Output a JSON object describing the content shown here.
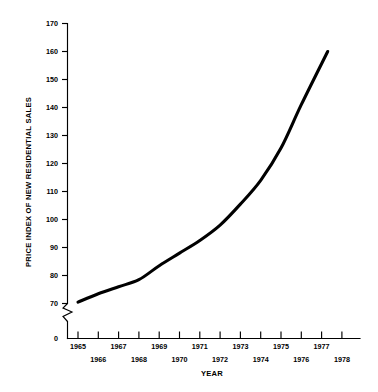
{
  "chart_data": {
    "type": "line",
    "title": "",
    "xlabel": "YEAR",
    "ylabel": "PRICE INDEX OF NEW RESIDENTIAL SALES",
    "xlim": [
      1964.5,
      1978.5
    ],
    "ylim": [
      70,
      170
    ],
    "axis_break": true,
    "axis_break_label": "0",
    "grid": false,
    "legend": null,
    "y_ticks": [
      70,
      80,
      90,
      100,
      110,
      120,
      130,
      140,
      150,
      160,
      170
    ],
    "y_tick_labels": [
      "70",
      "80",
      "90",
      "100",
      "110",
      "120",
      "130",
      "140",
      "150",
      "160",
      "170"
    ],
    "x_ticks": [
      1965,
      1966,
      1967,
      1968,
      1969,
      1970,
      1971,
      1972,
      1973,
      1974,
      1975,
      1976,
      1977,
      1978
    ],
    "x_tick_labels_top": [
      "1965",
      "1967",
      "1969",
      "1971",
      "1973",
      "1975",
      "1977"
    ],
    "x_tick_labels_bottom": [
      "1966",
      "1968",
      "1970",
      "1972",
      "1974",
      "1976",
      "1978"
    ],
    "x": [
      1965,
      1966,
      1967,
      1968,
      1969,
      1970,
      1971,
      1972,
      1973,
      1974,
      1975,
      1976,
      1977.3
    ],
    "values": [
      70.5,
      73.5,
      76.0,
      78.5,
      83.5,
      88.0,
      92.5,
      98.0,
      105.5,
      114.0,
      125.5,
      141.0,
      160.0
    ],
    "series": [
      {
        "name": "Price index of new residential sales",
        "values": [
          70.5,
          73.5,
          76.0,
          78.5,
          83.5,
          88.0,
          92.5,
          98.0,
          105.5,
          114.0,
          125.5,
          141.0,
          160.0
        ]
      }
    ],
    "line_color": "#000000",
    "background_color": "#ffffff"
  },
  "labels": {
    "y_axis_title": "PRICE INDEX OF NEW RESIDENTIAL SALES",
    "x_axis_title": "YEAR",
    "zero_label": "0",
    "y170": "170",
    "y160": "160",
    "y150": "150",
    "y140": "140",
    "y130": "130",
    "y120": "120",
    "y110": "110",
    "y100": "100",
    "y90": "90",
    "y80": "80",
    "y70": "70",
    "x1965": "1965",
    "x1966": "1966",
    "x1967": "1967",
    "x1968": "1968",
    "x1969": "1969",
    "x1970": "1970",
    "x1971": "1971",
    "x1972": "1972",
    "x1973": "1973",
    "x1974": "1974",
    "x1975": "1975",
    "x1976": "1976",
    "x1977": "1977",
    "x1978": "1978"
  }
}
